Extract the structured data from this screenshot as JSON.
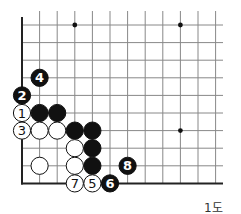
{
  "diagram": {
    "caption": "1도",
    "grid": {
      "x0": 22,
      "y0": 25,
      "dx": 17.6,
      "dy": 17.6,
      "cols": 12,
      "rows": 10,
      "right_extend": 223,
      "line_color": "#888888",
      "edge_color": "#222222",
      "left_edge": true,
      "bottom_edge": true
    },
    "hoshi": [
      {
        "col": 3,
        "row": 0
      },
      {
        "col": 9,
        "row": 0
      },
      {
        "col": 9,
        "row": 6
      }
    ],
    "stones": [
      {
        "color": "black",
        "col": 1,
        "row": 5,
        "label": ""
      },
      {
        "color": "black",
        "col": 2,
        "row": 5,
        "label": ""
      },
      {
        "color": "white",
        "col": 0,
        "row": 5,
        "label": "1"
      },
      {
        "color": "black",
        "col": 0,
        "row": 4,
        "label": "2"
      },
      {
        "color": "white",
        "col": 0,
        "row": 6,
        "label": "3"
      },
      {
        "color": "black",
        "col": 1,
        "row": 3,
        "label": "4"
      },
      {
        "color": "white",
        "col": 1,
        "row": 6,
        "label": ""
      },
      {
        "color": "white",
        "col": 2,
        "row": 6,
        "label": ""
      },
      {
        "color": "black",
        "col": 3,
        "row": 6,
        "label": ""
      },
      {
        "color": "black",
        "col": 4,
        "row": 6,
        "label": ""
      },
      {
        "color": "white",
        "col": 3,
        "row": 7,
        "label": ""
      },
      {
        "color": "black",
        "col": 4,
        "row": 7,
        "label": ""
      },
      {
        "color": "white",
        "col": 1,
        "row": 8,
        "label": ""
      },
      {
        "color": "white",
        "col": 3,
        "row": 8,
        "label": ""
      },
      {
        "color": "black",
        "col": 4,
        "row": 8,
        "label": ""
      },
      {
        "color": "white",
        "col": 4,
        "row": 9,
        "label": "5"
      },
      {
        "color": "black",
        "col": 5,
        "row": 9,
        "label": "6"
      },
      {
        "color": "white",
        "col": 3,
        "row": 9,
        "label": "7"
      },
      {
        "color": "black",
        "col": 6,
        "row": 8,
        "label": "8"
      }
    ]
  }
}
